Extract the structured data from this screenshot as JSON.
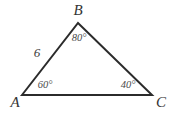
{
  "figure": {
    "type": "geometry-triangle-diagram",
    "background_color": "#ffffff",
    "stroke_color": "#2b2b2b",
    "stroke_width": 2,
    "canvas": {
      "width": 178,
      "height": 113
    },
    "vertices": [
      {
        "name": "A",
        "label": "A",
        "x": 22,
        "y": 95,
        "label_x": 15,
        "label_y": 102
      },
      {
        "name": "B",
        "label": "B",
        "x": 78,
        "y": 23,
        "label_x": 78,
        "label_y": 10
      },
      {
        "name": "C",
        "label": "C",
        "x": 152,
        "y": 95,
        "label_x": 161,
        "label_y": 102
      }
    ],
    "sides": [
      {
        "name": "AB",
        "label": "6",
        "label_x": 37,
        "label_y": 52
      },
      {
        "name": "BC",
        "label": "",
        "label_x": 0,
        "label_y": 0
      },
      {
        "name": "AC",
        "label": "",
        "label_x": 0,
        "label_y": 0
      }
    ],
    "angles": [
      {
        "at": "A",
        "label": "60°",
        "value": 60,
        "label_x": 45,
        "label_y": 85
      },
      {
        "at": "B",
        "label": "80°",
        "value": 80,
        "label_x": 79,
        "label_y": 38
      },
      {
        "at": "C",
        "label": "40°",
        "value": 40,
        "label_x": 128,
        "label_y": 85
      }
    ],
    "path_d": "M 22 95 L 78 23 L 152 95 Z"
  }
}
